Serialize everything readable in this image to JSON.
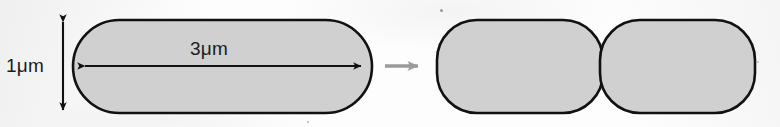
{
  "figure": {
    "kind": "biology-diagram",
    "canvas": {
      "width": 780,
      "height": 127
    },
    "background_color": "#fdfdfd"
  },
  "labels": {
    "height_dimension": "1μm",
    "width_dimension": "3μm"
  },
  "colors": {
    "cell_fill": "#d0d0d0",
    "cell_stroke": "#111111",
    "dimension_arrow": "#111111",
    "transition_arrow": "#9a9a9a",
    "background": "#fdfdfd"
  },
  "shapes": {
    "parent_cell": {
      "name": "parent-cell",
      "form": "stadium",
      "x": 73,
      "y": 20,
      "width": 299,
      "height": 93,
      "corner_radius": 46.5,
      "fill": "#d0d0d0",
      "stroke": "#111111",
      "stroke_width": 2.6
    },
    "daughter_cell_left": {
      "name": "daughter-cell-left",
      "form": "rounded-rect",
      "x": 437,
      "y": 20,
      "width": 166,
      "height": 93,
      "corner_radius": 40,
      "fill": "#d0d0d0",
      "stroke": "#111111",
      "stroke_width": 2.6
    },
    "daughter_cell_right": {
      "name": "daughter-cell-right",
      "form": "rounded-rect",
      "x": 600,
      "y": 20,
      "width": 155,
      "height": 93,
      "corner_radius": 40,
      "fill": "#d0d0d0",
      "stroke": "#111111",
      "stroke_width": 2.6
    }
  },
  "arrows": {
    "height_arrow": {
      "name": "height-dimension-arrow",
      "orientation": "vertical",
      "double_headed": true,
      "x": 63,
      "y_start": 15,
      "y_end": 117,
      "color": "#111111"
    },
    "width_arrow": {
      "name": "width-dimension-arrow",
      "orientation": "horizontal",
      "double_headed": true,
      "y": 66,
      "x_start": 77,
      "x_end": 369,
      "color": "#111111"
    },
    "transition_arrow": {
      "name": "division-transition-arrow",
      "orientation": "horizontal",
      "double_headed": false,
      "y": 66,
      "x_start": 385,
      "x_end": 427,
      "color": "#9a9a9a"
    }
  },
  "specks": [
    {
      "x": 440,
      "y": 9,
      "size": 3
    },
    {
      "x": 307,
      "y": 121,
      "size": 2
    },
    {
      "x": 757,
      "y": 61,
      "size": 2
    }
  ]
}
